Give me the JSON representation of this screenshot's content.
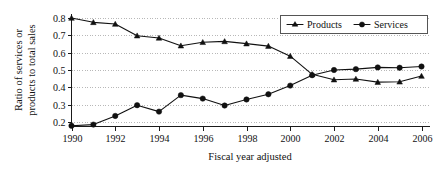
{
  "chart_data": {
    "type": "line",
    "title": "",
    "xlabel": "Fiscal year adjusted",
    "ylabel": "Ratio of services or products to total sales",
    "x": [
      1990,
      1991,
      1992,
      1993,
      1994,
      1995,
      1996,
      1997,
      1998,
      1999,
      2000,
      2001,
      2002,
      2003,
      2004,
      2005,
      2006
    ],
    "xlim": [
      1990,
      2006
    ],
    "ylim": [
      0.17,
      0.81
    ],
    "xticks": [
      1990,
      1992,
      1994,
      1996,
      1998,
      2000,
      2002,
      2004,
      2006
    ],
    "xtick_labels": [
      "1990",
      "1992",
      "1994",
      "1996",
      "1998",
      "2000",
      "2002",
      "2004",
      "2006"
    ],
    "yticks": [
      0.2,
      0.3,
      0.4,
      0.5,
      0.6,
      0.7,
      0.8
    ],
    "ytick_labels": [
      "0.2",
      "0.3",
      "0.4",
      "0.5",
      "0.6",
      "0.7",
      "0.8"
    ],
    "grid": "horizontal-dotted",
    "legend_position": "top-right",
    "series": [
      {
        "name": "Products",
        "marker": "triangle",
        "color": "#111111",
        "values": [
          0.8,
          0.775,
          0.765,
          0.698,
          0.685,
          0.64,
          0.66,
          0.665,
          0.652,
          0.638,
          0.58,
          0.475,
          0.444,
          0.448,
          0.43,
          0.432,
          0.465
        ]
      },
      {
        "name": "Services",
        "marker": "circle",
        "color": "#111111",
        "values": [
          0.178,
          0.185,
          0.235,
          0.297,
          0.26,
          0.355,
          0.335,
          0.295,
          0.33,
          0.36,
          0.41,
          0.47,
          0.5,
          0.505,
          0.515,
          0.513,
          0.52
        ]
      }
    ]
  },
  "legend": {
    "entries": [
      {
        "label": "Products"
      },
      {
        "label": "Services"
      }
    ]
  },
  "axes": {
    "y_label_line1": "Ratio of services or",
    "y_label_line2": "products to total sales",
    "x_label": "Fiscal year adjusted"
  }
}
